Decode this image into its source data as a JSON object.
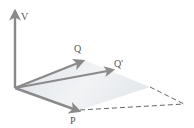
{
  "diagram": {
    "labels": {
      "v": "V",
      "q": "Q",
      "q_prime": "Q'",
      "p": "P"
    },
    "colors": {
      "vector": "#8a8a8a",
      "plane_fill": "#e9ecef",
      "dashed_edge": "#555555",
      "label": "#555555"
    }
  }
}
